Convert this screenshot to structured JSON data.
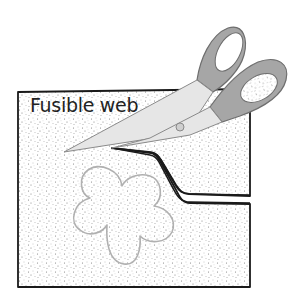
{
  "illustration": {
    "label": "Fusible web",
    "colors": {
      "background": "#ffffff",
      "sheet_outline": "#1a1a1a",
      "speckle": "#7a7a7a",
      "flower_outline": "#b0b0b0",
      "scissor_handle": "#a6a6a6",
      "scissor_handle_outline": "#6e6e6e",
      "scissor_blade": "#e6e6e6",
      "blade_outline": "#8a8a8a",
      "cut_line": "#1a1a1a"
    },
    "elements": [
      {
        "name": "fusible-web-sheet",
        "shape": "rectangle-with-cut-slit"
      },
      {
        "name": "flower-template-outline",
        "shape": "five-petal-flower"
      },
      {
        "name": "scissors",
        "state": "open, cutting into sheet from right edge"
      }
    ]
  }
}
